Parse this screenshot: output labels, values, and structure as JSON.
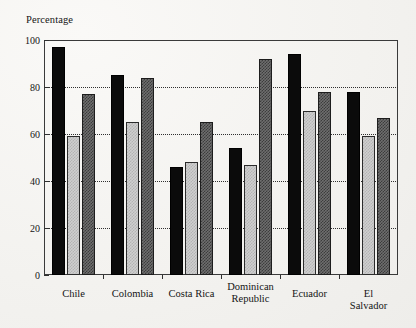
{
  "chart_data": {
    "type": "bar",
    "title": "",
    "ylabel": "Percentage",
    "xlabel": "",
    "ylim": [
      0,
      100
    ],
    "yticks": [
      0,
      20,
      40,
      60,
      80,
      100
    ],
    "grid": true,
    "legend": "none",
    "categories": [
      "Chile",
      "Colombia",
      "Costa Rica",
      "Dominican\nRepublic",
      "Ecuador",
      "El Salvador"
    ],
    "series": [
      {
        "name": "series-1",
        "style": "solid-black",
        "values": [
          97,
          85,
          46,
          54,
          94,
          78
        ]
      },
      {
        "name": "series-2",
        "style": "light-gray-stipple",
        "values": [
          59,
          65,
          48,
          47,
          70,
          59
        ]
      },
      {
        "name": "series-3",
        "style": "dark-gray-stipple",
        "values": [
          77,
          84,
          65,
          92,
          78,
          67
        ]
      }
    ]
  },
  "axis": {
    "y_title": "Percentage",
    "y_tick_labels": [
      "100",
      "80",
      "60",
      "40",
      "20",
      "0"
    ],
    "x_tick_labels": [
      "Chile",
      "Colombia",
      "Costa Rica",
      "Dominican\nRepublic",
      "Ecuador",
      "El Salvador"
    ]
  },
  "colors": {
    "background": "#f5f4f2",
    "frame": "#3a3a3a",
    "grid": "#2f2f2f",
    "text": "#141414",
    "series_1": "#0b0b0b",
    "series_2": "#cfcfcf",
    "series_3": "#6e6e6e"
  }
}
